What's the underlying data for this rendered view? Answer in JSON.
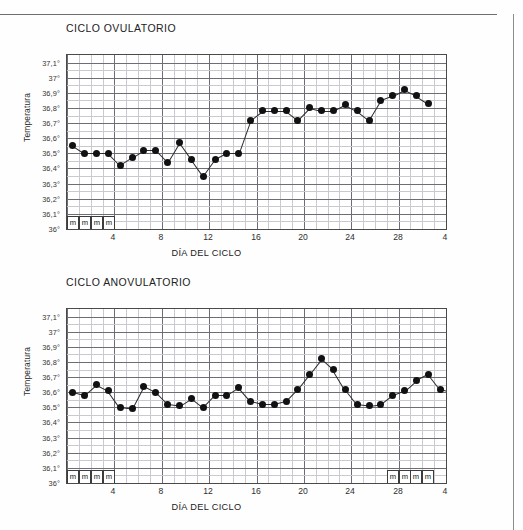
{
  "document": {
    "background_color": "#fefefe",
    "rule_color": "#6f6f6f"
  },
  "axis_common": {
    "ylabel": "Temperatura",
    "xlabel": "DÍA DEL CICLO",
    "y_ticks": [
      "37,1°",
      "37°",
      "36,9°",
      "36,8°",
      "36,7°",
      "36,6°",
      "36,5°",
      "36,4°",
      "36,3°",
      "36,2°",
      "36,1°",
      "36°"
    ],
    "x_ticks": [
      "4",
      "8",
      "12",
      "16",
      "20",
      "24",
      "28",
      "4"
    ],
    "menstruation_mark": "m",
    "point_color": "#111111",
    "line_color": "#2b2b2b",
    "grid_minor_color": "#c9c9cf",
    "grid_major_color": "#6d6d78"
  },
  "chart_data": [
    {
      "type": "line",
      "id": "ovulatory",
      "title": "CICLO OVULATORIO",
      "xlabel": "DÍA DEL CICLO",
      "ylabel": "Temperatura",
      "ylim": [
        36.0,
        37.15
      ],
      "xlim": [
        1,
        32
      ],
      "grid": true,
      "legend": "none",
      "y_ticks": [
        37.1,
        37.0,
        36.9,
        36.8,
        36.7,
        36.6,
        36.5,
        36.4,
        36.3,
        36.2,
        36.1,
        36.0
      ],
      "y_tick_labels": [
        "37,1°",
        "37°",
        "36,9°",
        "36,8°",
        "36,7°",
        "36,6°",
        "36,5°",
        "36,4°",
        "36,3°",
        "36,2°",
        "36,1°",
        "36°"
      ],
      "x_ticks": [
        4,
        8,
        12,
        16,
        20,
        24,
        28,
        32
      ],
      "x_tick_labels": [
        "4",
        "8",
        "12",
        "16",
        "20",
        "24",
        "28",
        "4"
      ],
      "x": [
        1,
        2,
        3,
        4,
        5,
        6,
        7,
        8,
        9,
        10,
        11,
        12,
        13,
        14,
        15,
        16,
        17,
        18,
        19,
        20,
        21,
        22,
        23,
        24,
        25,
        26,
        27,
        28,
        29,
        30,
        31
      ],
      "values": [
        36.55,
        36.5,
        36.5,
        36.5,
        36.42,
        36.47,
        36.52,
        36.52,
        36.44,
        36.57,
        36.46,
        36.35,
        36.46,
        36.5,
        36.5,
        36.72,
        36.78,
        36.78,
        36.78,
        36.72,
        36.8,
        36.78,
        36.78,
        36.82,
        36.78,
        36.72,
        36.85,
        36.88,
        36.92,
        36.88,
        36.83
      ],
      "menstruation_days_start": [
        1,
        2,
        3,
        4
      ],
      "menstruation_days_end": []
    },
    {
      "type": "line",
      "id": "anovulatory",
      "title": "CICLO ANOVULATORIO",
      "xlabel": "DÍA DEL CICLO",
      "ylabel": "Temperatura",
      "ylim": [
        36.0,
        37.15
      ],
      "xlim": [
        1,
        32
      ],
      "grid": true,
      "legend": "none",
      "y_ticks": [
        37.1,
        37.0,
        36.9,
        36.8,
        36.7,
        36.6,
        36.5,
        36.4,
        36.3,
        36.2,
        36.1,
        36.0
      ],
      "y_tick_labels": [
        "37,1°",
        "37°",
        "36,9°",
        "36,8°",
        "36,7°",
        "36,6°",
        "36,5°",
        "36,4°",
        "36,3°",
        "36,2°",
        "36,1°",
        "36°"
      ],
      "x_ticks": [
        4,
        8,
        12,
        16,
        20,
        24,
        28,
        32
      ],
      "x_tick_labels": [
        "4",
        "8",
        "12",
        "16",
        "20",
        "24",
        "28",
        "4"
      ],
      "x": [
        1,
        2,
        3,
        4,
        5,
        6,
        7,
        8,
        9,
        10,
        11,
        12,
        13,
        14,
        15,
        16,
        17,
        18,
        19,
        20,
        21,
        22,
        23,
        24,
        25,
        26,
        27,
        28,
        29,
        30,
        31
      ],
      "values": [
        36.6,
        36.58,
        36.65,
        36.61,
        36.5,
        36.49,
        36.64,
        36.6,
        36.52,
        36.51,
        36.56,
        36.5,
        36.58,
        36.58,
        36.63,
        36.54,
        36.52,
        36.52,
        36.54,
        36.62,
        36.72,
        36.82,
        36.75,
        36.62,
        36.52,
        36.51,
        36.52,
        36.58,
        36.61,
        36.68,
        36.72,
        36.62,
        36.6
      ],
      "menstruation_days_start": [
        1,
        2,
        3,
        4
      ],
      "menstruation_days_end": [
        28,
        29,
        30,
        31
      ]
    }
  ]
}
